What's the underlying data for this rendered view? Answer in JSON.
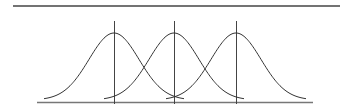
{
  "diagram": {
    "type": "overlapping-gaussian-curves",
    "curve_count": 3,
    "centers_px": [
      114,
      174,
      236
    ],
    "colors": {
      "background": "#ffffff",
      "curve_stroke": "#333333",
      "line_stroke": "#555555",
      "axis_stroke": "#777777"
    }
  }
}
